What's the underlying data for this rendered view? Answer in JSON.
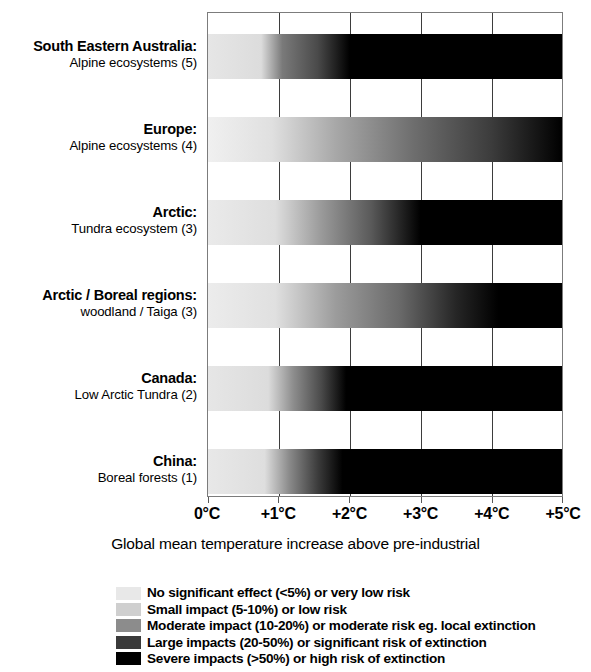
{
  "chart_data": {
    "type": "heatmap",
    "title": "",
    "xlabel": "Global mean temperature increase above pre-industrial",
    "ylabel": "",
    "xlim": [
      0,
      5
    ],
    "xtick_labels": [
      "0°C",
      "+1°C",
      "+2°C",
      "+3°C",
      "+4°C",
      "+5°C"
    ],
    "xtick_values": [
      0,
      1,
      2,
      3,
      4,
      5
    ],
    "grid": true,
    "legend_position": "below",
    "categories": [
      "South Eastern Australia: Alpine ecosystems (5)",
      "Europe: Alpine ecosystems (4)",
      "Arctic: Tundra ecosystem (3)",
      "Arctic / Boreal regions: woodland / Taiga (3)",
      "Canada: Low Arctic Tundra (2)",
      "China: Boreal forests (1)"
    ],
    "series": [
      {
        "name": "South Eastern Australia: Alpine ecosystems (5)",
        "line1": "South Eastern Australia:",
        "line2": "Alpine ecosystems (5)",
        "stops": [
          {
            "x": 0.0,
            "color": "#e6e6e6"
          },
          {
            "x": 0.75,
            "color": "#dcdcdc"
          },
          {
            "x": 1.05,
            "color": "#7a7a7a"
          },
          {
            "x": 1.55,
            "color": "#4a4a4a"
          },
          {
            "x": 2.0,
            "color": "#000000"
          },
          {
            "x": 5.0,
            "color": "#000000"
          }
        ]
      },
      {
        "name": "Europe: Alpine ecosystems (4)",
        "line1": "Europe:",
        "line2": "Alpine ecosystems (4)",
        "stops": [
          {
            "x": 0.0,
            "color": "#f0f0f0"
          },
          {
            "x": 0.9,
            "color": "#e0e0e0"
          },
          {
            "x": 1.8,
            "color": "#a8a8a8"
          },
          {
            "x": 2.9,
            "color": "#6e6e6e"
          },
          {
            "x": 4.0,
            "color": "#3c3c3c"
          },
          {
            "x": 5.0,
            "color": "#000000"
          }
        ]
      },
      {
        "name": "Arctic: Tundra ecosystem (3)",
        "line1": "Arctic:",
        "line2": "Tundra ecosystem (3)",
        "stops": [
          {
            "x": 0.0,
            "color": "#eaeaea"
          },
          {
            "x": 0.95,
            "color": "#dedede"
          },
          {
            "x": 1.6,
            "color": "#9a9a9a"
          },
          {
            "x": 2.3,
            "color": "#5a5a5a"
          },
          {
            "x": 3.0,
            "color": "#000000"
          },
          {
            "x": 5.0,
            "color": "#000000"
          }
        ]
      },
      {
        "name": "Arctic / Boreal regions: woodland / Taiga (3)",
        "line1": "Arctic / Boreal regions:",
        "line2": "woodland / Taiga (3)",
        "stops": [
          {
            "x": 0.0,
            "color": "#ececec"
          },
          {
            "x": 0.95,
            "color": "#e0e0e0"
          },
          {
            "x": 1.8,
            "color": "#9c9c9c"
          },
          {
            "x": 2.7,
            "color": "#6a6a6a"
          },
          {
            "x": 3.5,
            "color": "#262626"
          },
          {
            "x": 4.1,
            "color": "#000000"
          },
          {
            "x": 5.0,
            "color": "#000000"
          }
        ]
      },
      {
        "name": "Canada: Low Arctic Tundra (2)",
        "line1": "Canada:",
        "line2": "Low Arctic Tundra (2)",
        "stops": [
          {
            "x": 0.0,
            "color": "#e6e6e6"
          },
          {
            "x": 0.85,
            "color": "#dcdcdc"
          },
          {
            "x": 1.2,
            "color": "#8e8e8e"
          },
          {
            "x": 1.6,
            "color": "#4a4a4a"
          },
          {
            "x": 1.95,
            "color": "#000000"
          },
          {
            "x": 5.0,
            "color": "#000000"
          }
        ]
      },
      {
        "name": "China: Boreal forests (1)",
        "line1": "China:",
        "line2": "Boreal forests (1)",
        "stops": [
          {
            "x": 0.0,
            "color": "#e8e8e8"
          },
          {
            "x": 0.8,
            "color": "#dedede"
          },
          {
            "x": 1.15,
            "color": "#8a8a8a"
          },
          {
            "x": 1.55,
            "color": "#3c3c3c"
          },
          {
            "x": 1.9,
            "color": "#000000"
          },
          {
            "x": 5.0,
            "color": "#000000"
          }
        ]
      }
    ],
    "legend": [
      {
        "label": "No significant effect (<5%) or very low risk",
        "color": "#e8e8e8"
      },
      {
        "label": "Small impact (5-10%) or low risk",
        "color": "#cfcfcf"
      },
      {
        "label": "Moderate impact (10-20%) or moderate risk eg. local extinction",
        "color": "#8c8c8c"
      },
      {
        "label": "Large impacts (20-50%) or significant risk of extinction",
        "color": "#3a3a3a"
      },
      {
        "label": "Severe impacts (>50%) or high risk of extinction",
        "color": "#000000"
      }
    ]
  }
}
